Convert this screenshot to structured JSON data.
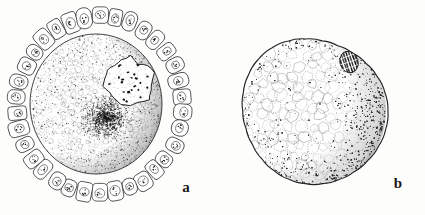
{
  "plate": {
    "kind": "scientific-illustration-plate",
    "background_color": "#fdfdfc",
    "ink_color": "#1a1a1a",
    "width": 425,
    "height": 215,
    "caption_visible": false
  },
  "figures": [
    {
      "id": "figure-a",
      "label": "a",
      "label_position": {
        "x": 186,
        "y": 192
      },
      "subject": "ovarian follicle containing oocyte with germinal vesicle",
      "center": {
        "x": 100,
        "y": 105
      },
      "parts": [
        {
          "name": "follicular-epithelium-ring",
          "description": "single layer of columnar follicle cells surrounding the oocyte",
          "cell_count": 34,
          "ring_radius_x": 92,
          "ring_radius_y": 98,
          "cell_length": 19,
          "cell_width": 15
        },
        {
          "name": "follicle-cell-nucleus",
          "description": "oval nucleus with dark chromatin granules inside each follicle cell",
          "granules_per_nucleus": 6
        },
        {
          "name": "perivitelline-space",
          "description": "clear gap between follicular epithelium and oocyte surface"
        },
        {
          "name": "oocyte-body",
          "description": "large stippled ooplasm filled with fine yolk vesicles",
          "radius_x": 66,
          "radius_y": 70,
          "center": {
            "x": 96,
            "y": 104
          }
        },
        {
          "name": "vitelline-membrane",
          "description": "dark shaded rim along the right and lower margin of the oocyte"
        },
        {
          "name": "germinal-vesicle",
          "description": "pale irregular nucleus with scattered dark chromatin blocks",
          "center": {
            "x": 128,
            "y": 82
          },
          "radius": 26,
          "chromatin_blocks": 22
        },
        {
          "name": "yolk-nucleus",
          "description": "dense dark stippled Balbiani body beneath the germinal vesicle",
          "center": {
            "x": 106,
            "y": 118
          },
          "radius": 24
        }
      ]
    },
    {
      "id": "figure-b",
      "label": "b",
      "label_position": {
        "x": 398,
        "y": 188
      },
      "subject": "isolated oocyte with polygonal yolk vesicles",
      "center": {
        "x": 314,
        "y": 111
      },
      "parts": [
        {
          "name": "oocyte-outline",
          "description": "continuous dark ovoid contour of the isolated egg",
          "radius_x": 71,
          "radius_y": 74
        },
        {
          "name": "yolk-vesicle-network",
          "description": "polygonal mosaic of yolk vesicles filling the cytoplasm",
          "cell_count": 150
        },
        {
          "name": "germinal-vesicle-b",
          "description": "small oval nucleus with dark vertical hatching near upper right",
          "center": {
            "x": 349,
            "y": 62
          },
          "radius_x": 9,
          "radius_y": 11,
          "hatch_lines": 7
        },
        {
          "name": "marginal-shading",
          "description": "heavy stipple shading along right margin giving rounded relief"
        }
      ]
    }
  ]
}
